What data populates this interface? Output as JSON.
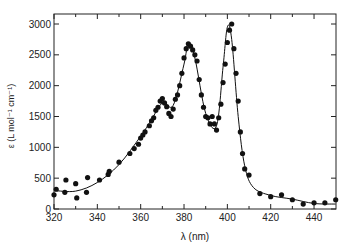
{
  "chart_data": {
    "type": "scatter",
    "title": "",
    "xlabel": "λ (nm)",
    "ylabel": "ε (L mol⁻¹ cm⁻¹)",
    "xlim": [
      320,
      450
    ],
    "ylim": [
      0,
      3150
    ],
    "xticks": [
      320,
      340,
      360,
      380,
      400,
      420,
      440
    ],
    "yticks": [
      0,
      500,
      1000,
      1500,
      2000,
      2500,
      3000
    ],
    "grid": false,
    "legend": null,
    "series": [
      {
        "name": "measured",
        "style": "points",
        "x": [
          320,
          321,
          325,
          325.5,
          330,
          330.5,
          335,
          335.5,
          341,
          345,
          345.5,
          350,
          355,
          357,
          359,
          360,
          361,
          362,
          364,
          365,
          366,
          367,
          368,
          369,
          370,
          371,
          372,
          373,
          374,
          375,
          376,
          377,
          378,
          379,
          380,
          381,
          382,
          383,
          384,
          385,
          386,
          387,
          388,
          389,
          390,
          391,
          392,
          393,
          394,
          395,
          396,
          397,
          398,
          399,
          400,
          401,
          402,
          403,
          404,
          405,
          406,
          407,
          408,
          410,
          415,
          420,
          425,
          430,
          435,
          440,
          445,
          450
        ],
        "y": [
          230,
          320,
          270,
          470,
          410,
          180,
          270,
          510,
          470,
          560,
          610,
          760,
          900,
          980,
          1050,
          1150,
          1200,
          1250,
          1350,
          1430,
          1480,
          1600,
          1650,
          1750,
          1790,
          1720,
          1660,
          1550,
          1500,
          1620,
          1780,
          1850,
          2000,
          2200,
          2450,
          2600,
          2680,
          2640,
          2580,
          2500,
          2400,
          2100,
          1850,
          1650,
          1500,
          1480,
          1380,
          1500,
          1380,
          1280,
          1480,
          1700,
          2050,
          2350,
          2700,
          2900,
          3000,
          2600,
          2200,
          1750,
          1250,
          900,
          650,
          550,
          250,
          200,
          230,
          150,
          80,
          100,
          100,
          150
        ]
      },
      {
        "name": "fit",
        "style": "line",
        "x": [
          320,
          330,
          340,
          350,
          360,
          365,
          370,
          375,
          380,
          382,
          385,
          390,
          395,
          398,
          400,
          402,
          405,
          408,
          412,
          420,
          430,
          440,
          450
        ],
        "y": [
          300,
          290,
          430,
          720,
          1180,
          1450,
          1720,
          1680,
          2350,
          2680,
          2450,
          1550,
          1350,
          2300,
          2950,
          2750,
          1500,
          700,
          350,
          220,
          160,
          90,
          80
        ]
      }
    ]
  }
}
